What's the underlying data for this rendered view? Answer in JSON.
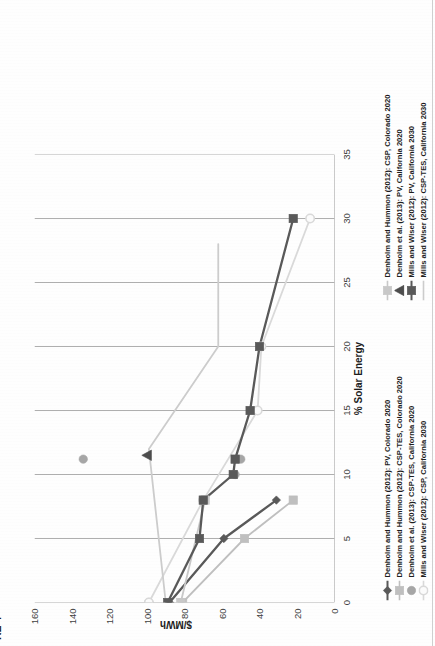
{
  "figure": {
    "caption": "RE 4",
    "caption_full_hint": "FIGURE 4"
  },
  "chart_data": {
    "type": "line",
    "title": "",
    "xlabel": "% Solar Energy",
    "ylabel": "$/MWh",
    "xlim": [
      0,
      35
    ],
    "ylim": [
      0,
      160
    ],
    "xticks": [
      "0",
      "5",
      "10",
      "15",
      "20",
      "25",
      "30",
      "35"
    ],
    "yticks": [
      "0",
      "20",
      "40",
      "60",
      "80",
      "100",
      "120",
      "140",
      "160"
    ],
    "grid": "vertical-only",
    "legend_position": "bottom",
    "series": [
      {
        "name": "Denholm and Hummon (2012): PV, Colorado 2020",
        "marker": "diamond",
        "color": "#595959",
        "style": "line-marker",
        "x": [
          0,
          5,
          8
        ],
        "y": [
          88,
          59,
          31
        ]
      },
      {
        "name": "Denholm and Hummon (2012): CSP-TES, Colorado 2020",
        "marker": "square",
        "color": "#bfbfbf",
        "style": "line-marker",
        "x": [
          0,
          5,
          8
        ],
        "y": [
          81,
          48,
          22
        ]
      },
      {
        "name": "Denholm et al. (2013): CSP-TES, California 2020",
        "marker": "circle",
        "color": "#a6a6a6",
        "style": "marker-only",
        "x": [
          0,
          8,
          10,
          11.2,
          11.2
        ],
        "y": [
          99,
          70,
          53,
          50,
          134
        ]
      },
      {
        "name": "Mills and Wiser (2012): CSP, California 2030",
        "marker": "circle-open",
        "color": "#d9d9d9",
        "style": "line-marker",
        "x": [
          0,
          8,
          15,
          20,
          30
        ],
        "y": [
          99,
          70,
          41,
          39,
          13
        ]
      },
      {
        "name": "Denholm and Hummon (2012): CSP, Colorado 2020",
        "marker": "square",
        "color": "#c8c8c8",
        "style": "line-marker",
        "x": [
          0,
          8
        ],
        "y": [
          82,
          69
        ]
      },
      {
        "name": "Denholm et al. (2013): PV, California 2020",
        "marker": "triangle",
        "color": "#4d4d4d",
        "style": "marker-only",
        "x": [
          11.5
        ],
        "y": [
          100
        ]
      },
      {
        "name": "Mills and Wiser (2012): PV, California 2030",
        "marker": "square",
        "color": "#595959",
        "style": "line-marker",
        "x": [
          0,
          5,
          8,
          10,
          11.2,
          15,
          20,
          30
        ],
        "y": [
          89,
          72,
          70,
          54,
          53,
          45,
          40,
          22
        ]
      },
      {
        "name": "Mills and Wiser (2012): CSP-TES, California 2030",
        "marker": "none",
        "color": "#cccccc",
        "style": "line-only",
        "x": [
          0,
          12,
          20,
          28
        ],
        "y": [
          90,
          99,
          62,
          62
        ]
      }
    ]
  },
  "legend": {
    "column1": [
      {
        "label": "Denholm and Hummon (2012): PV, Colorado 2020",
        "marker": "diamond-line",
        "color": "#595959"
      },
      {
        "label": "Denholm and Hummon (2012): CSP-TES, Colorado 2020",
        "marker": "square-line",
        "color": "#bfbfbf"
      },
      {
        "label": "Denholm et al. (2013): CSP-TES, California 2020",
        "marker": "circle",
        "color": "#a6a6a6"
      },
      {
        "label": "Mills and Wiser (2012): CSP, California 2030",
        "marker": "circle-open-line",
        "color": "#d9d9d9"
      }
    ],
    "column2": [
      {
        "label": "Denholm and Hummon (2012): CSP, Colorado 2020",
        "marker": "square-line",
        "color": "#c8c8c8"
      },
      {
        "label": "Denholm et al. (2013): PV, California 2020",
        "marker": "triangle",
        "color": "#4d4d4d"
      },
      {
        "label": "Mills and Wiser (2012): PV, California 2030",
        "marker": "square-line",
        "color": "#595959"
      },
      {
        "label": "Mills and Wiser (2012): CSP-TES, California 2030",
        "marker": "line",
        "color": "#cccccc"
      }
    ]
  }
}
